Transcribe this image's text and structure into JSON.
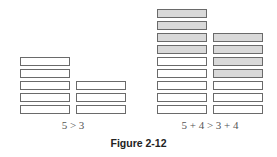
{
  "figure_label": "Figure 2-12",
  "panels": [
    {
      "caption": "5 > 3",
      "stacks": [
        {
          "total": 5,
          "shaded": 0
        },
        {
          "total": 3,
          "shaded": 0
        }
      ]
    },
    {
      "caption": "5 + 4 > 3 + 4",
      "stacks": [
        {
          "total": 9,
          "shaded": 4
        },
        {
          "total": 7,
          "shaded": 4
        }
      ]
    }
  ],
  "colors": {
    "shaded_fill": "#d9d9d9",
    "outline": "#6a6a6a"
  }
}
